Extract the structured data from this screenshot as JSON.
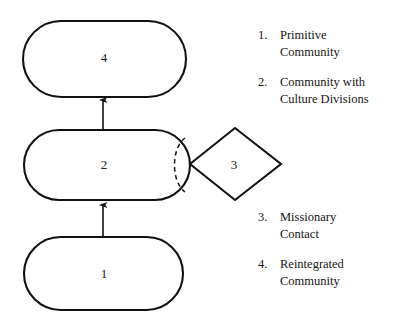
{
  "diagram": {
    "type": "flow-diagram",
    "background_color": "#ffffff",
    "stroke_color": "#111111",
    "nodes": [
      {
        "id": "node-4",
        "shape": "stadium",
        "label": "4",
        "x": 23,
        "y": 21,
        "width": 163,
        "height": 76
      },
      {
        "id": "node-2",
        "shape": "stadium",
        "label": "2",
        "x": 24,
        "y": 130,
        "width": 166,
        "height": 70,
        "inner_divider": "dashed-arc"
      },
      {
        "id": "node-1",
        "shape": "stadium",
        "label": "1",
        "x": 24,
        "y": 237,
        "width": 159,
        "height": 73
      },
      {
        "id": "node-3",
        "shape": "diamond",
        "label": "3",
        "x": 190,
        "y": 128,
        "width": 91,
        "height": 72
      }
    ],
    "arrows": [
      {
        "id": "arrow-1-to-2",
        "from": "node-1",
        "to": "node-2",
        "direction": "up",
        "x": 103,
        "y_start": 236,
        "y_end": 204
      },
      {
        "id": "arrow-2-to-4",
        "from": "node-2",
        "to": "node-4",
        "direction": "up",
        "x": 103,
        "y_start": 129,
        "y_end": 99
      }
    ]
  },
  "legend_top": {
    "items": [
      {
        "number": "1.",
        "lines": [
          "Primitive",
          "Community"
        ]
      },
      {
        "number": "2.",
        "lines": [
          "Community with",
          "Culture Divisions"
        ]
      }
    ]
  },
  "legend_bottom": {
    "items": [
      {
        "number": "3.",
        "lines": [
          "Missionary",
          "Contact"
        ]
      },
      {
        "number": "4.",
        "lines": [
          "Reintegrated",
          "Community"
        ]
      }
    ]
  }
}
